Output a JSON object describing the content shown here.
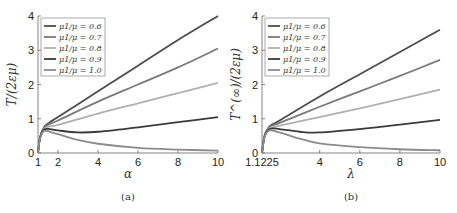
{
  "chart_data": [
    {
      "type": "line",
      "caption": "(a)",
      "xlabel": "α",
      "ylabel": "T/(2εμ)",
      "xlim": [
        1,
        10
      ],
      "ylim": [
        0,
        4
      ],
      "xticks": [
        "1",
        "2",
        "4",
        "6",
        "8",
        "10"
      ],
      "yticks": [
        "0",
        "1",
        "2",
        "3",
        "4"
      ],
      "grid": false,
      "legend_position": "upper left",
      "series": [
        {
          "name": "μ1/μ = 0.6",
          "color": "#4d4d4d",
          "x": [
            1,
            1.1,
            1.3,
            1.6,
            2,
            4,
            6,
            8,
            10
          ],
          "values": [
            0,
            0.45,
            0.75,
            0.9,
            1.05,
            1.8,
            2.55,
            3.3,
            4.0
          ]
        },
        {
          "name": "μ1/μ = 0.7",
          "color": "#7a7a7a",
          "x": [
            1,
            1.1,
            1.3,
            1.6,
            2,
            4,
            6,
            8,
            10
          ],
          "values": [
            0,
            0.45,
            0.73,
            0.85,
            0.95,
            1.5,
            2.0,
            2.5,
            3.05
          ]
        },
        {
          "name": "μ1/μ = 0.8",
          "color": "#b0b0b0",
          "x": [
            1,
            1.1,
            1.3,
            1.6,
            2,
            4,
            6,
            8,
            10
          ],
          "values": [
            0,
            0.44,
            0.7,
            0.78,
            0.82,
            1.15,
            1.45,
            1.75,
            2.05
          ]
        },
        {
          "name": "μ1/μ = 0.9",
          "color": "#3a3a3a",
          "x": [
            1,
            1.1,
            1.3,
            1.6,
            2,
            3,
            4,
            6,
            8,
            10
          ],
          "values": [
            0,
            0.44,
            0.68,
            0.7,
            0.66,
            0.6,
            0.62,
            0.75,
            0.9,
            1.05
          ]
        },
        {
          "name": "μ1/μ = 1.0",
          "color": "#8c8c8c",
          "x": [
            1,
            1.1,
            1.3,
            1.6,
            2,
            3,
            4,
            6,
            8,
            10
          ],
          "values": [
            0,
            0.42,
            0.64,
            0.62,
            0.55,
            0.38,
            0.27,
            0.15,
            0.1,
            0.07
          ]
        }
      ]
    },
    {
      "type": "line",
      "caption": "(b)",
      "xlabel": "λ",
      "ylabel": "T^(∞)/(2εμ)",
      "xlim": [
        1.1225,
        10
      ],
      "ylim": [
        0,
        4
      ],
      "xticks": [
        "1.1225",
        "4",
        "6",
        "8",
        "10"
      ],
      "yticks": [
        "0",
        "1",
        "2",
        "3",
        "4"
      ],
      "grid": false,
      "legend_position": "upper left",
      "series": [
        {
          "name": "μ1/μ = 0.6",
          "color": "#4d4d4d",
          "x": [
            1.1225,
            1.25,
            1.5,
            2,
            4,
            6,
            8,
            10
          ],
          "values": [
            0,
            0.5,
            0.78,
            0.95,
            1.65,
            2.3,
            2.95,
            3.6
          ]
        },
        {
          "name": "μ1/μ = 0.7",
          "color": "#7a7a7a",
          "x": [
            1.1225,
            1.25,
            1.5,
            2,
            4,
            6,
            8,
            10
          ],
          "values": [
            0,
            0.5,
            0.76,
            0.88,
            1.35,
            1.8,
            2.25,
            2.72
          ]
        },
        {
          "name": "μ1/μ = 0.8",
          "color": "#b0b0b0",
          "x": [
            1.1225,
            1.25,
            1.5,
            2,
            4,
            6,
            8,
            10
          ],
          "values": [
            0,
            0.48,
            0.72,
            0.8,
            1.05,
            1.3,
            1.57,
            1.85
          ]
        },
        {
          "name": "μ1/μ = 0.9",
          "color": "#3a3a3a",
          "x": [
            1.1225,
            1.25,
            1.5,
            2,
            3,
            4,
            6,
            8,
            10
          ],
          "values": [
            0,
            0.48,
            0.7,
            0.7,
            0.62,
            0.6,
            0.7,
            0.83,
            0.97
          ]
        },
        {
          "name": "μ1/μ = 1.0",
          "color": "#8c8c8c",
          "x": [
            1.1225,
            1.25,
            1.5,
            2,
            3,
            4,
            6,
            8,
            10
          ],
          "values": [
            0,
            0.46,
            0.66,
            0.6,
            0.42,
            0.28,
            0.17,
            0.11,
            0.08
          ]
        }
      ]
    }
  ]
}
